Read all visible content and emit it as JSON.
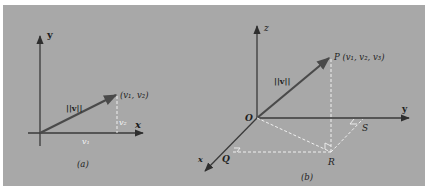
{
  "figure": {
    "background_color": "#a8a8a8",
    "axis_color": "#3a3a3a",
    "vector_color": "#4a4a4a",
    "dashed_color": "#f0f0f0",
    "panel_a": {
      "caption": "(a)",
      "axis_labels": {
        "x": "x",
        "y": "y"
      },
      "point_label": "(v₁, v₂)",
      "vector_label": "||v||",
      "component_labels": {
        "horizontal": "v₁",
        "vertical": "v₂"
      }
    },
    "panel_b": {
      "caption": "(b)",
      "axis_labels": {
        "x": "x",
        "y": "y",
        "z": "z"
      },
      "origin_label": "O",
      "point_label": "P (v₁, v₂, v₃)",
      "vector_label": "||v||",
      "point_labels": {
        "Q": "Q",
        "R": "R",
        "S": "S"
      }
    }
  }
}
